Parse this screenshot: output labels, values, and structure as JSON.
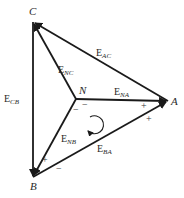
{
  "diagram": {
    "type": "graph",
    "nodes": [
      {
        "id": "C",
        "label": "C",
        "x": 33,
        "y": 22,
        "label_x": 29,
        "label_y": 15
      },
      {
        "id": "A",
        "label": "A",
        "x": 168,
        "y": 101,
        "label_x": 171,
        "label_y": 105
      },
      {
        "id": "B",
        "label": "B",
        "x": 33,
        "y": 177,
        "label_x": 30,
        "label_y": 190
      },
      {
        "id": "N",
        "label": "N",
        "x": 76,
        "y": 99,
        "label_x": 79,
        "label_y": 94
      }
    ],
    "edges": [
      {
        "id": "E_AC",
        "from": "A",
        "to": "C",
        "main": "E",
        "sub": "AC",
        "label_x": 96,
        "label_y": 56
      },
      {
        "id": "E_NC",
        "from": "N",
        "to": "C",
        "main": "E",
        "sub": "NC",
        "label_x": 58,
        "label_y": 73
      },
      {
        "id": "E_CB",
        "from": "C",
        "to": "B",
        "main": "E",
        "sub": "CB",
        "label_x": 4,
        "label_y": 102
      },
      {
        "id": "E_NA",
        "from": "N",
        "to": "A",
        "main": "E",
        "sub": "NA",
        "label_x": 114,
        "label_y": 95
      },
      {
        "id": "E_NB",
        "from": "N",
        "to": "B",
        "main": "E",
        "sub": "NB",
        "label_x": 61,
        "label_y": 142
      },
      {
        "id": "E_BA",
        "from": "B",
        "to": "A",
        "main": "E",
        "sub": "BA",
        "label_x": 97,
        "label_y": 152
      }
    ],
    "signs": [
      {
        "symbol": "−",
        "x": 82,
        "y": 108
      },
      {
        "symbol": "−",
        "x": 73,
        "y": 113
      },
      {
        "symbol": "+",
        "x": 141,
        "y": 109
      },
      {
        "symbol": "+",
        "x": 146,
        "y": 122
      },
      {
        "symbol": "+",
        "x": 42,
        "y": 163
      },
      {
        "symbol": "−",
        "x": 56,
        "y": 172
      }
    ],
    "loop_arrow": {
      "cx": 94,
      "cy": 125,
      "r": 9,
      "direction": "clockwise"
    },
    "colors": {
      "line": "#1a1a1a",
      "text": "#2a2a2a",
      "background": "#ffffff"
    }
  }
}
